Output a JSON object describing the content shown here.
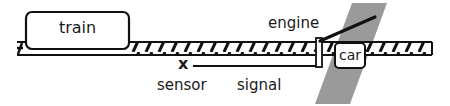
{
  "diagram": {
    "labels": {
      "train": "train",
      "engine": "engine",
      "car": "car",
      "sensor": "sensor",
      "signal": "signal"
    },
    "sensor_mark": "x",
    "colors": {
      "stroke": "#111111",
      "road_band": "#9a9a9a",
      "background": "#ffffff"
    }
  }
}
